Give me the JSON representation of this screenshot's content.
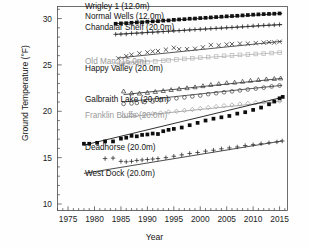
{
  "chart_data": {
    "type": "scatter",
    "title": "",
    "xlabel": "Year",
    "ylabel": "Ground Temperature (°F)",
    "xlim": [
      1973,
      2016.5
    ],
    "ylim": [
      9.3,
      31.3
    ],
    "xticks": [
      1975,
      1980,
      1985,
      1990,
      1995,
      2000,
      2005,
      2010,
      2015
    ],
    "xticklabels": [
      "1975",
      "1980",
      "1985",
      "1990",
      "1995",
      "2000",
      "2005",
      "2010",
      "2015"
    ],
    "yticks": [
      10,
      15,
      20,
      25,
      30
    ],
    "yticklabels": [
      "10",
      "15",
      "20",
      "25",
      "30"
    ],
    "minor_ticks": true,
    "grid": false,
    "legend_position": "inline-labels",
    "series": [
      {
        "name": "Wrigley 1 (12.0m)",
        "marker": "filled-square",
        "color": "#111111",
        "label_x": 1978.2,
        "label_y": 31.0,
        "trend": [
          [
            1984.0,
            29.45
          ],
          [
            2015.5,
            30.55
          ]
        ],
        "x": [
          1984.0,
          1985.0,
          1986.0,
          1987.0,
          1988.0,
          1989.0,
          1990.0,
          1991.0,
          1992.0,
          1993.0,
          1994.0,
          1995.0,
          1996.0,
          1997.0,
          1998.0,
          1999.0,
          2000.0,
          2001.0,
          2002.0,
          2003.0,
          2004.0,
          2005.0,
          2006.0,
          2007.0,
          2008.0,
          2009.0,
          2010.0,
          2011.0,
          2012.0,
          2013.0,
          2014.0,
          2015.0
        ],
        "y": [
          29.44,
          29.48,
          29.5,
          29.55,
          29.58,
          29.6,
          29.66,
          29.7,
          29.72,
          29.78,
          29.8,
          29.86,
          29.9,
          29.93,
          29.98,
          30.0,
          30.05,
          30.08,
          30.12,
          30.16,
          30.2,
          30.24,
          30.27,
          30.3,
          30.34,
          30.38,
          30.42,
          30.45,
          30.48,
          30.5,
          30.52,
          30.55
        ]
      },
      {
        "name": "Normal Wells (12.0m)",
        "marker": "plus",
        "color": "#2a2a2a",
        "label_x": 1978.2,
        "label_y": 30.0,
        "trend": [
          [
            1984.0,
            28.3
          ],
          [
            2015.5,
            29.35
          ]
        ],
        "x": [
          1984.0,
          1985.0,
          1986.0,
          1987.0,
          1988.0,
          1989.0,
          1990.0,
          1991.0,
          1992.0,
          1993.0,
          1994.0,
          1995.0,
          1996.0,
          1997.0,
          1998.0,
          1999.0,
          2000.0,
          2001.0,
          2002.0,
          2003.0,
          2004.0,
          2005.0,
          2006.0,
          2007.0,
          2008.0,
          2009.0,
          2010.0,
          2011.0,
          2012.0,
          2013.0,
          2014.0,
          2015.0
        ],
        "y": [
          28.3,
          28.32,
          28.34,
          28.4,
          28.42,
          28.45,
          28.5,
          28.52,
          28.56,
          28.6,
          28.64,
          28.68,
          28.7,
          28.74,
          28.78,
          28.82,
          28.85,
          28.88,
          28.92,
          28.95,
          28.98,
          29.02,
          29.05,
          29.08,
          29.12,
          29.16,
          29.2,
          29.24,
          29.27,
          29.3,
          29.32,
          29.35
        ]
      },
      {
        "name": "Chandalar Shelf (20.0m)",
        "marker": "cross",
        "color": "#3a3a3a",
        "label_x": 1978.2,
        "label_y": 28.8,
        "trend": [
          [
            1984.5,
            25.75
          ],
          [
            2015.5,
            27.55
          ]
        ],
        "x": [
          1984.5,
          1986.0,
          1987.0,
          1988.5,
          1990.0,
          1991.0,
          1992.0,
          1993.5,
          1995.0,
          1996.0,
          1997.5,
          1999.0,
          2000.5,
          2002.0,
          2003.5,
          2005.0,
          2006.0,
          2007.5,
          2009.0,
          2010.5,
          2012.0,
          2013.0,
          2014.0,
          2015.0
        ],
        "y": [
          25.7,
          25.95,
          26.1,
          26.25,
          26.35,
          26.45,
          26.5,
          26.65,
          26.85,
          26.7,
          26.7,
          26.75,
          26.9,
          27.15,
          27.1,
          27.2,
          27.25,
          27.3,
          27.3,
          27.35,
          27.4,
          27.45,
          27.42,
          27.5
        ]
      },
      {
        "name": "Old Man (15.0m)",
        "marker": "open-square",
        "color": "#b5b5b5",
        "label_x": 1978.2,
        "label_y": 25.15,
        "trend": [
          [
            1984.0,
            25.15
          ],
          [
            2015.5,
            26.35
          ]
        ],
        "x": [
          1984.0,
          1985.0,
          1986.0,
          1987.0,
          1988.0,
          1989.0,
          1990.0,
          1991.5,
          1993.0,
          1994.0,
          1995.5,
          1997.0,
          1998.5,
          2000.0,
          2001.5,
          2003.0,
          2004.5,
          2006.0,
          2007.5,
          2009.0,
          2010.5,
          2012.0,
          2013.5,
          2015.0
        ],
        "y": [
          25.1,
          25.12,
          25.14,
          25.2,
          25.22,
          25.28,
          25.3,
          25.38,
          25.45,
          25.5,
          25.58,
          25.65,
          25.72,
          25.78,
          25.85,
          25.9,
          25.98,
          26.02,
          26.08,
          26.12,
          26.18,
          26.22,
          26.28,
          26.32
        ]
      },
      {
        "name": "Happy Valley (20.0m)",
        "marker": "triangle",
        "color": "#333333",
        "label_x": 1978.2,
        "label_y": 24.3,
        "trend": [
          [
            1985.5,
            21.8
          ],
          [
            2015.5,
            23.55
          ]
        ],
        "x": [
          1985.5,
          1987.0,
          1988.5,
          1990.0,
          1991.5,
          1993.0,
          1994.5,
          1996.0,
          1997.5,
          1999.0,
          2000.5,
          2002.0,
          2003.5,
          2005.0,
          2006.5,
          2008.0,
          2009.5,
          2011.0,
          2012.5,
          2014.0,
          2015.2
        ],
        "y": [
          22.15,
          21.95,
          21.92,
          22.0,
          22.1,
          22.2,
          22.3,
          22.4,
          22.5,
          22.6,
          22.72,
          22.85,
          22.95,
          23.05,
          23.1,
          23.2,
          23.3,
          23.38,
          23.45,
          23.5,
          23.55
        ]
      },
      {
        "name": "Galbraith Lake (20.0m)",
        "marker": "open-circle",
        "color": "#3d3d3d",
        "label_x": 1978.2,
        "label_y": 21.0,
        "trend": [
          [
            1985.5,
            21.0
          ],
          [
            2015.5,
            22.8
          ]
        ],
        "x": [
          1985.5,
          1987.0,
          1988.0,
          1989.5,
          1991.0,
          1992.5,
          1994.0,
          1995.5,
          1997.0,
          1998.5,
          2000.0,
          2001.5,
          2003.0,
          2004.5,
          2006.0,
          2007.5,
          2009.0,
          2010.5,
          2012.0,
          2013.5,
          2015.0
        ],
        "y": [
          20.8,
          20.85,
          20.9,
          21.0,
          21.05,
          21.2,
          21.3,
          21.4,
          21.5,
          21.6,
          21.7,
          21.85,
          21.95,
          22.05,
          22.15,
          22.25,
          22.35,
          22.45,
          22.55,
          22.68,
          22.78
        ]
      },
      {
        "name": "Franklin Bluffs (20.0m)",
        "marker": "open-diamond",
        "color": "#9e9e9e",
        "label_x": 1978.2,
        "label_y": 19.3,
        "trend": [
          [
            1985.5,
            19.35
          ],
          [
            2015.5,
            21.1
          ]
        ],
        "x": [
          1985.5,
          1987.0,
          1988.0,
          1989.5,
          1991.0,
          1992.5,
          1994.0,
          1995.5,
          1997.0,
          1998.5,
          2000.0,
          2001.5,
          2003.0,
          2004.5,
          2006.0,
          2007.5,
          2009.0,
          2010.5,
          2012.0,
          2013.5,
          2015.0
        ],
        "y": [
          19.5,
          19.55,
          19.6,
          19.65,
          19.72,
          19.82,
          19.92,
          20.0,
          20.1,
          20.2,
          20.3,
          20.4,
          20.5,
          20.6,
          20.68,
          20.78,
          20.85,
          20.92,
          21.0,
          21.05,
          21.1
        ]
      },
      {
        "name": "Deadhorse (20.0m)",
        "marker": "filled-square",
        "color": "#0d0d0d",
        "label_x": 1978.2,
        "label_y": 15.85,
        "trend": [
          [
            1978.0,
            16.35
          ],
          [
            2015.5,
            21.5
          ]
        ],
        "x": [
          1978.0,
          1979.0,
          1980.5,
          1982.0,
          1983.5,
          1985.0,
          1986.0,
          1987.0,
          1988.0,
          1989.0,
          1990.0,
          1991.0,
          1992.0,
          1993.0,
          1994.0,
          1995.0,
          1996.5,
          1998.0,
          1999.5,
          2001.0,
          2002.5,
          2004.0,
          2005.5,
          2007.0,
          2008.5,
          2010.0,
          2011.5,
          2013.0,
          2014.0,
          2015.0,
          2015.6
        ],
        "y": [
          16.5,
          16.5,
          16.6,
          16.75,
          16.75,
          17.05,
          17.15,
          17.35,
          17.3,
          17.45,
          17.5,
          17.6,
          17.55,
          17.85,
          18.0,
          18.1,
          18.25,
          18.5,
          18.75,
          19.0,
          19.2,
          19.35,
          19.5,
          19.75,
          19.9,
          20.15,
          20.4,
          20.75,
          21.05,
          21.4,
          21.55
        ]
      },
      {
        "name": "West Dock (20.0m)",
        "marker": "plus",
        "color": "#2c2c2c",
        "label_x": 1978.2,
        "label_y": 13.0,
        "trend": [
          [
            1978.0,
            13.3
          ],
          [
            2015.5,
            16.8
          ]
        ],
        "x": [
          1982.0,
          1983.5,
          1985.0,
          1986.0,
          1987.0,
          1988.0,
          1989.0,
          1990.0,
          1991.0,
          1992.0,
          1993.5,
          1995.0,
          1996.5,
          1998.0,
          1999.5,
          2001.0,
          2002.5,
          2004.0,
          2005.5,
          2007.0,
          2008.5,
          2010.0,
          2011.5,
          2013.0,
          2014.5,
          2015.5
        ],
        "y": [
          14.9,
          14.95,
          14.6,
          14.55,
          14.6,
          14.7,
          14.75,
          14.8,
          14.85,
          14.9,
          15.0,
          15.15,
          15.3,
          15.45,
          15.55,
          15.7,
          15.8,
          15.95,
          16.05,
          16.15,
          16.3,
          16.4,
          16.5,
          16.6,
          16.7,
          16.8
        ]
      }
    ]
  }
}
